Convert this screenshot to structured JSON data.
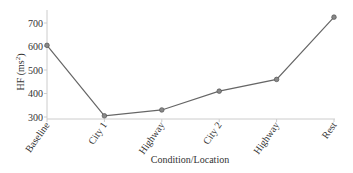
{
  "chart_data": {
    "type": "line",
    "title": "",
    "xlabel": "Condition/Location",
    "ylabel": "HF (ms²)",
    "ylabel_main": "HF (ms",
    "ylabel_sup": "2",
    "ylabel_close": ")",
    "categories": [
      "Baseline",
      "City 1",
      "Highway",
      "City 2",
      "Highway",
      "Rest"
    ],
    "series": [
      {
        "name": "HF",
        "values": [
          605,
          305,
          330,
          410,
          460,
          725
        ]
      }
    ],
    "ylim": [
      290,
      760
    ],
    "yticks": [
      300,
      400,
      500,
      600,
      700
    ],
    "grid": false,
    "legend": "none",
    "line_color": "#666666",
    "marker_color": "#888888"
  }
}
